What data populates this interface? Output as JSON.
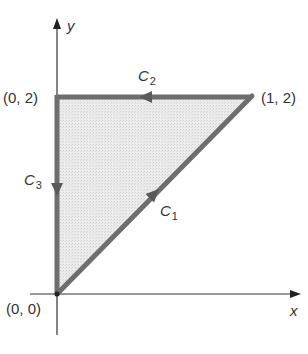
{
  "diagram": {
    "type": "line-integral-path",
    "axes": {
      "x_label": "x",
      "y_label": "y"
    },
    "points": [
      {
        "id": "origin",
        "label": "(0, 0)",
        "coords": [
          0,
          0
        ]
      },
      {
        "id": "top-left",
        "label": "(0, 2)",
        "coords": [
          0,
          2
        ]
      },
      {
        "id": "top-right",
        "label": "(1, 2)",
        "coords": [
          1,
          2
        ]
      }
    ],
    "curves": [
      {
        "id": "C1",
        "name": "C",
        "subscript": "1",
        "from": [
          0,
          0
        ],
        "to": [
          1,
          2
        ],
        "direction": "up-right"
      },
      {
        "id": "C2",
        "name": "C",
        "subscript": "2",
        "from": [
          1,
          2
        ],
        "to": [
          0,
          2
        ],
        "direction": "left"
      },
      {
        "id": "C3",
        "name": "C",
        "subscript": "3",
        "from": [
          0,
          2
        ],
        "to": [
          0,
          0
        ],
        "direction": "down"
      }
    ],
    "region": {
      "shaded": true,
      "fill": "#e3e3e3"
    },
    "colors": {
      "path": "#6e6e6e",
      "axes": "#333333",
      "text": "#333333"
    }
  }
}
